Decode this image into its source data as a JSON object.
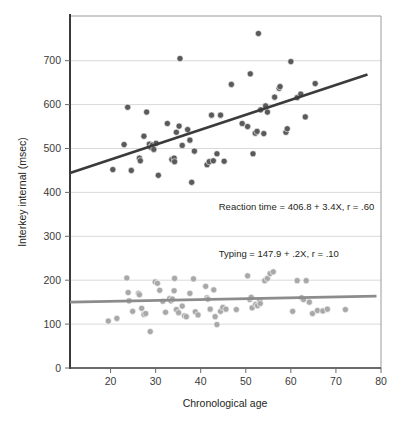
{
  "chart_data": {
    "type": "scatter",
    "title": "",
    "xlabel": "Chronological age",
    "ylabel": "Interkey internal (msec)",
    "xlim": [
      11,
      80
    ],
    "ylim": [
      0,
      760
    ],
    "xticks": [
      20,
      30,
      40,
      50,
      60,
      70,
      80
    ],
    "yticks": [
      0,
      100,
      200,
      300,
      400,
      500,
      600,
      700
    ],
    "grid": "horizontal",
    "legend": "none",
    "annotations": [
      {
        "id": "reaction-time-equation",
        "text": "Reaction time = 406.8 + 3.4X, r = .60",
        "x": 44,
        "y": 360
      },
      {
        "id": "typing-equation",
        "text": "Typing = 147.9 + .2X, r = .10",
        "x": 44,
        "y": 253
      }
    ],
    "series": [
      {
        "name": "Reaction time",
        "color": "#4a4a4a",
        "marker": "circle",
        "fit": {
          "intercept": 406.8,
          "slope": 3.4,
          "r": 0.6,
          "color": "#3b3b3b",
          "x_start": 11,
          "x_end": 77
        },
        "points": [
          [
            20.5,
            452
          ],
          [
            23.0,
            509
          ],
          [
            23.8,
            594
          ],
          [
            24.6,
            450
          ],
          [
            26.4,
            478
          ],
          [
            26.6,
            472
          ],
          [
            27.4,
            528
          ],
          [
            28.0,
            583
          ],
          [
            28.6,
            510
          ],
          [
            28.9,
            503
          ],
          [
            29.3,
            508
          ],
          [
            29.6,
            498
          ],
          [
            30.1,
            512
          ],
          [
            30.6,
            439
          ],
          [
            32.6,
            557
          ],
          [
            33.6,
            475
          ],
          [
            34.1,
            478
          ],
          [
            34.2,
            470
          ],
          [
            34.6,
            537
          ],
          [
            35.2,
            551
          ],
          [
            35.4,
            705
          ],
          [
            35.9,
            507
          ],
          [
            37.1,
            543
          ],
          [
            37.6,
            519
          ],
          [
            38.0,
            423
          ],
          [
            38.6,
            494
          ],
          [
            41.4,
            463
          ],
          [
            41.9,
            470
          ],
          [
            42.4,
            576
          ],
          [
            42.8,
            472
          ],
          [
            43.6,
            488
          ],
          [
            44.4,
            576
          ],
          [
            45.2,
            471
          ],
          [
            46.8,
            646
          ],
          [
            49.2,
            557
          ],
          [
            50.4,
            550
          ],
          [
            51.0,
            670
          ],
          [
            51.6,
            488
          ],
          [
            52.1,
            535
          ],
          [
            52.5,
            539
          ],
          [
            52.8,
            762
          ],
          [
            53.3,
            588
          ],
          [
            54.0,
            534
          ],
          [
            54.4,
            597
          ],
          [
            54.8,
            583
          ],
          [
            56.4,
            617
          ],
          [
            57.4,
            637
          ],
          [
            57.6,
            641
          ],
          [
            58.9,
            537
          ],
          [
            59.2,
            545
          ],
          [
            60.0,
            698
          ],
          [
            61.4,
            616
          ],
          [
            62.2,
            624
          ],
          [
            63.2,
            572
          ],
          [
            65.4,
            648
          ]
        ]
      },
      {
        "name": "Typing",
        "color": "#a2a2a2",
        "marker": "circle",
        "fit": {
          "intercept": 147.9,
          "slope": 0.2,
          "r": 0.1,
          "color": "#8c8c8c",
          "x_start": 11,
          "x_end": 79
        },
        "points": [
          [
            19.5,
            107
          ],
          [
            21.4,
            113
          ],
          [
            23.6,
            205
          ],
          [
            23.9,
            172
          ],
          [
            24.1,
            153
          ],
          [
            24.9,
            129
          ],
          [
            26.2,
            170
          ],
          [
            26.4,
            167
          ],
          [
            26.9,
            136
          ],
          [
            27.4,
            122
          ],
          [
            27.8,
            124
          ],
          [
            28.8,
            83
          ],
          [
            29.9,
            196
          ],
          [
            30.4,
            193
          ],
          [
            30.9,
            177
          ],
          [
            31.6,
            152
          ],
          [
            32.2,
            127
          ],
          [
            33.1,
            158
          ],
          [
            33.4,
            153
          ],
          [
            33.7,
            157
          ],
          [
            34.1,
            176
          ],
          [
            34.2,
            204
          ],
          [
            34.6,
            133
          ],
          [
            35.1,
            126
          ],
          [
            35.9,
            141
          ],
          [
            36.4,
            119
          ],
          [
            36.8,
            117
          ],
          [
            37.6,
            170
          ],
          [
            38.4,
            203
          ],
          [
            38.8,
            128
          ],
          [
            39.4,
            121
          ],
          [
            41.1,
            186
          ],
          [
            41.4,
            160
          ],
          [
            41.6,
            157
          ],
          [
            42.1,
            134
          ],
          [
            42.9,
            178
          ],
          [
            43.2,
            117
          ],
          [
            43.6,
            99
          ],
          [
            44.4,
            129
          ],
          [
            44.9,
            138
          ],
          [
            45.6,
            134
          ],
          [
            47.9,
            133
          ],
          [
            50.4,
            210
          ],
          [
            50.9,
            156
          ],
          [
            51.2,
            161
          ],
          [
            51.4,
            137
          ],
          [
            52.2,
            145
          ],
          [
            52.6,
            142
          ],
          [
            53.1,
            153
          ],
          [
            53.2,
            147
          ],
          [
            54.2,
            199
          ],
          [
            54.8,
            204
          ],
          [
            55.4,
            215
          ],
          [
            56.1,
            219
          ],
          [
            60.4,
            129
          ],
          [
            61.4,
            199
          ],
          [
            62.4,
            160
          ],
          [
            62.8,
            156
          ],
          [
            63.4,
            199
          ],
          [
            64.1,
            150
          ],
          [
            64.8,
            124
          ],
          [
            65.9,
            131
          ],
          [
            67.1,
            130
          ],
          [
            68.1,
            134
          ],
          [
            72.1,
            133
          ]
        ]
      }
    ]
  },
  "axes": {
    "x_tick_labels": [
      "20",
      "30",
      "40",
      "50",
      "60",
      "70",
      "80"
    ],
    "y_tick_labels": [
      "0",
      "100",
      "200",
      "300",
      "400",
      "500",
      "600",
      "700"
    ],
    "x_axis_title": "Chronological age",
    "y_axis_title": "Interkey internal (msec)"
  },
  "style": {
    "background": "#ffffff",
    "frame_color": "#3a3a3a",
    "grid_color": "#d9d9d9",
    "upper_point_color": "#5a5a5a",
    "lower_point_color": "#a8a8a8",
    "upper_line_color": "#3b3b3b",
    "lower_line_color": "#8c8c8c",
    "text_color": "#231f20"
  }
}
